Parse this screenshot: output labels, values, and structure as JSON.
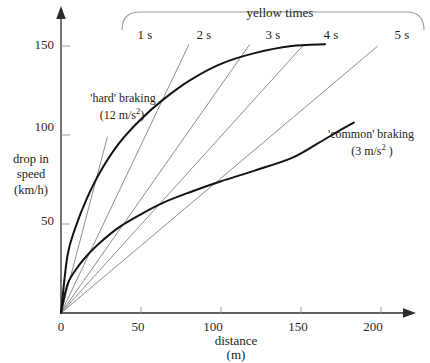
{
  "chart_data": {
    "type": "line",
    "title": "",
    "xlabel": "distance",
    "xlabel_unit": "(m)",
    "ylabel_line1": "drop in",
    "ylabel_line2": "speed",
    "ylabel_unit": "(km/h)",
    "xlim": [
      0,
      215
    ],
    "ylim": [
      0,
      160
    ],
    "xticks": [
      0,
      50,
      100,
      150,
      200
    ],
    "xticklabels": [
      "0",
      "50",
      "100",
      "150",
      "200"
    ],
    "yticks": [
      50,
      100,
      150
    ],
    "yticklabels": [
      "50",
      "100",
      "150"
    ],
    "grid": false,
    "legend_position": "inline-annotations",
    "series": [
      {
        "name": "'hard' braking",
        "annotation_line1": "'hard' braking",
        "annotation_line2_prefix": "(12 m/s",
        "annotation_line2_exp": "2",
        "annotation_line2_suffix": ")",
        "deceleration_m_s2": 12,
        "style": "thick-curve",
        "points": [
          [
            0,
            0
          ],
          [
            4,
            32
          ],
          [
            9,
            48
          ],
          [
            16,
            64
          ],
          [
            25,
            80
          ],
          [
            36,
            95
          ],
          [
            49,
            108
          ],
          [
            64,
            120
          ],
          [
            81,
            131
          ],
          [
            100,
            140
          ],
          [
            121,
            146
          ],
          [
            144,
            150
          ],
          [
            165,
            151
          ]
        ]
      },
      {
        "name": "'common' braking",
        "annotation_line1": "'common' braking",
        "annotation_line2_prefix": "(3 m/s",
        "annotation_line2_exp": "2",
        "annotation_line2_suffix": " )",
        "deceleration_m_s2": 3,
        "style": "thick-curve",
        "points": [
          [
            0,
            0
          ],
          [
            4,
            16
          ],
          [
            9,
            24
          ],
          [
            16,
            32
          ],
          [
            25,
            40
          ],
          [
            36,
            48
          ],
          [
            49,
            55
          ],
          [
            64,
            62
          ],
          [
            81,
            68
          ],
          [
            100,
            74
          ],
          [
            121,
            80
          ],
          [
            144,
            87
          ],
          [
            160,
            95
          ],
          [
            175,
            103
          ],
          [
            183,
            107
          ]
        ]
      }
    ],
    "yellow_time_lines": [
      {
        "label": "1 s",
        "seconds": 1,
        "end": [
          29,
          99
        ]
      },
      {
        "label": "2 s",
        "seconds": 2,
        "end": [
          80,
          151
        ]
      },
      {
        "label": "3 s",
        "seconds": 3,
        "end": [
          118,
          151
        ]
      },
      {
        "label": "4 s",
        "seconds": 4,
        "end": [
          152,
          151
        ]
      },
      {
        "label": "5 s",
        "seconds": 5,
        "end": [
          198,
          150
        ]
      }
    ],
    "bracket_label": "yellow times"
  },
  "axes": {
    "x_arrow": "arrow-right",
    "y_arrow": "arrow-up"
  }
}
